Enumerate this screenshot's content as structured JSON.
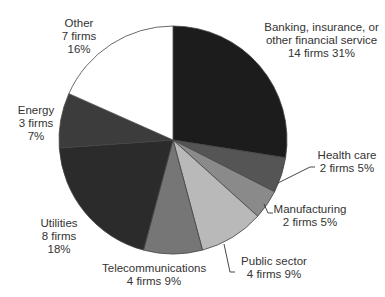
{
  "chart_data": {
    "type": "pie",
    "title": "",
    "center": [
      173,
      140
    ],
    "radius": 114,
    "start_angle_deg": 0,
    "direction": "clockwise",
    "slices": [
      {
        "name": "Banking, insurance, or other financial service",
        "firms": 14,
        "percent": 31,
        "label_lines": [
          "Banking, insurance, or",
          "other financial service",
          "14 firms 31%"
        ],
        "color": "#1c1c1c",
        "span_deg": 99
      },
      {
        "name": "Health care",
        "firms": 2,
        "percent": 5,
        "label_lines": [
          "Health care",
          "2 firms 5%"
        ],
        "color": "#555555",
        "span_deg": 18
      },
      {
        "name": "Manufacturing",
        "firms": 2,
        "percent": 5,
        "label_lines": [
          "Manufacturing",
          "2 firms 5%"
        ],
        "color": "#8a8a8a",
        "span_deg": 15
      },
      {
        "name": "Public sector",
        "firms": 4,
        "percent": 9,
        "label_lines": [
          "Public sector",
          "4 firms 9%"
        ],
        "color": "#b9b9b9",
        "span_deg": 33
      },
      {
        "name": "Telecommunications",
        "firms": 4,
        "percent": 9,
        "label_lines": [
          "Telecommunications",
          "4 firms 9%"
        ],
        "color": "#767676",
        "span_deg": 30
      },
      {
        "name": "Utilities",
        "firms": 8,
        "percent": 18,
        "label_lines": [
          "Utilities",
          "8 firms",
          "18%"
        ],
        "color": "#2b2b2b",
        "span_deg": 71
      },
      {
        "name": "Energy",
        "firms": 3,
        "percent": 7,
        "label_lines": [
          "Energy",
          "3 firms",
          "7%"
        ],
        "color": "#3c3c3c",
        "span_deg": 28
      },
      {
        "name": "Other",
        "firms": 7,
        "percent": 16,
        "label_lines": [
          "Other",
          "7 firms",
          "16%"
        ],
        "color": "#ffffff",
        "span_deg": 66
      }
    ],
    "legend": "none"
  },
  "labels": {
    "banking": {
      "l1": "Banking, insurance, or",
      "l2": "other financial service",
      "l3": "14 firms 31%"
    },
    "health": {
      "l1": "Health care",
      "l2": "2 firms 5%"
    },
    "manufacturing": {
      "l1": "Manufacturing",
      "l2": "2 firms 5%"
    },
    "public": {
      "l1": "Public sector",
      "l2": "4 firms 9%"
    },
    "telecom": {
      "l1": "Telecommunications",
      "l2": "4 firms 9%"
    },
    "utilities": {
      "l1": "Utilities",
      "l2": "8 firms",
      "l3": "18%"
    },
    "energy": {
      "l1": "Energy",
      "l2": "3 firms",
      "l3": "7%"
    },
    "other": {
      "l1": "Other",
      "l2": "7 firms",
      "l3": "16%"
    }
  }
}
